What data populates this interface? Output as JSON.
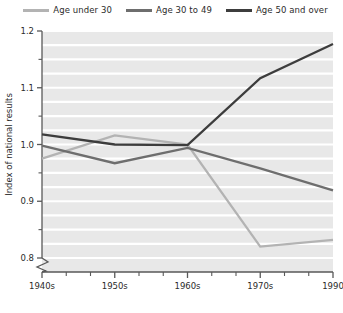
{
  "chart_data": {
    "type": "line",
    "title": "",
    "xlabel": "",
    "ylabel": "Index of national results",
    "x": [
      "1940s",
      "1950s",
      "1960s",
      "1970s",
      "1990"
    ],
    "xtick_labels": [
      "1940s",
      "1950s",
      "1960s",
      "1970s",
      "1990"
    ],
    "ytick_labels": [
      "0.8",
      "0.9",
      "1.0",
      "1.1",
      "1.2"
    ],
    "ytick_values": [
      0.8,
      0.9,
      1.0,
      1.1,
      1.2
    ],
    "yminor_values": [
      0.825,
      0.85,
      0.875,
      0.925,
      0.95,
      0.975,
      1.025,
      1.05,
      1.075,
      1.125,
      1.15,
      1.175
    ],
    "ylim": [
      0.78,
      1.2
    ],
    "axis_break": true,
    "grid": "horizontal-white-minor",
    "legend_position": "top",
    "plot_background": "#e8e8e8",
    "gridline_color": "#ffffff",
    "series": [
      {
        "name": "Age under 30",
        "color": "#b3b3b3",
        "values": [
          0.975,
          1.016,
          1.0,
          0.82,
          0.832
        ]
      },
      {
        "name": "Age 30 to 49",
        "color": "#6e6e6e",
        "values": [
          0.998,
          0.967,
          0.994,
          0.958,
          0.919
        ]
      },
      {
        "name": "Age 50 and over",
        "color": "#3d3d3d",
        "values": [
          1.018,
          1.0,
          0.999,
          1.117,
          1.177
        ]
      }
    ]
  },
  "legend": {
    "items": [
      {
        "label": "Age under 30",
        "color": "#b3b3b3",
        "swatch": "line-swatch"
      },
      {
        "label": "Age 30 to 49",
        "color": "#6e6e6e",
        "swatch": "line-swatch"
      },
      {
        "label": "Age 50 and over",
        "color": "#3d3d3d",
        "swatch": "line-swatch"
      }
    ]
  },
  "axes": {
    "y_title": "Index of national results",
    "y_labels": [
      "1.2",
      "1.1",
      "1.0",
      "0.9",
      "0.8"
    ],
    "x_labels": [
      "1940s",
      "1950s",
      "1960s",
      "1970s",
      "1990"
    ]
  }
}
